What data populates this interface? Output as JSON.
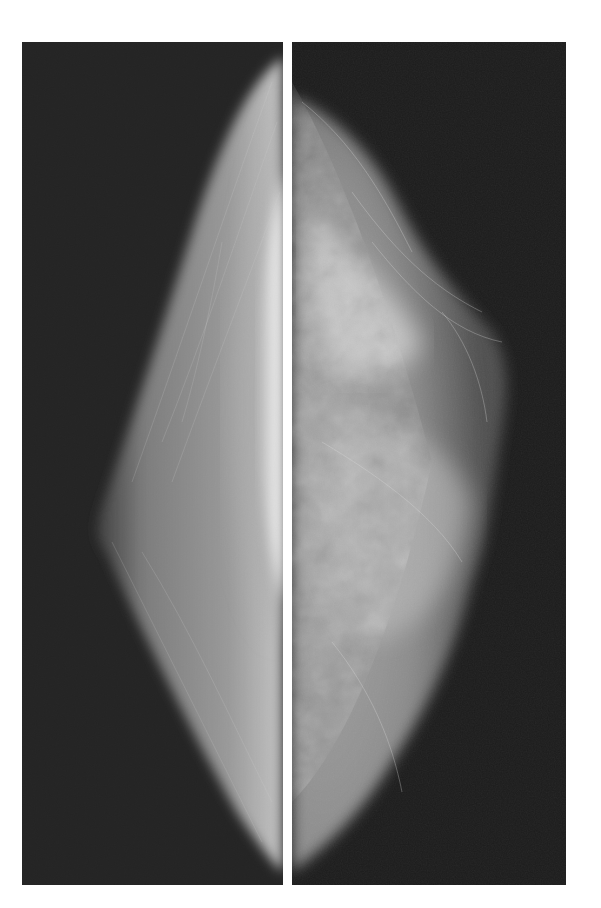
{
  "figure": {
    "background": "#ffffff",
    "panel_background": "#1a1a1a",
    "panels": [
      {
        "id": "left",
        "description": "mammogram view, fatty/fibroglandular tissue with bright chest-wall edge"
      },
      {
        "id": "right",
        "description": "mammogram view, dense fibroglandular tissue"
      }
    ]
  }
}
